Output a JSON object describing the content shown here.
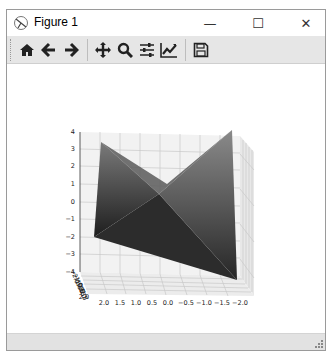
{
  "window": {
    "title": "Figure 1",
    "controls": {
      "minimize": "—",
      "maximize": "☐",
      "close": "✕"
    }
  },
  "toolbar": {
    "buttons": [
      {
        "name": "home",
        "icon": "home-icon"
      },
      {
        "name": "back",
        "icon": "arrow-left-icon"
      },
      {
        "name": "forward",
        "icon": "arrow-right-icon"
      },
      {
        "name": "pan",
        "icon": "move-icon"
      },
      {
        "name": "zoom",
        "icon": "magnifier-icon"
      },
      {
        "name": "configure-subplots",
        "icon": "sliders-icon"
      },
      {
        "name": "edit-axis",
        "icon": "chart-line-icon"
      },
      {
        "name": "save",
        "icon": "floppy-disk-icon"
      }
    ]
  },
  "plot": {
    "type": "surface3d",
    "z_ticks": [
      "4",
      "3",
      "2",
      "1",
      "0",
      "−1",
      "−2",
      "−3",
      "−4"
    ],
    "x_ticks": [
      "2.0",
      "1.5",
      "1.0",
      "0.5",
      "0.0",
      "−0.5",
      "−1.0",
      "−1.5",
      "−2.0"
    ],
    "y_ticks": [
      "−2.0",
      "−1.5",
      "−1.0",
      "−0.5",
      "0.0",
      "0.5",
      "1.0",
      "1.5",
      "2.0"
    ],
    "surface_color": "#3a3a3a"
  },
  "statusbar": {
    "text": ""
  }
}
